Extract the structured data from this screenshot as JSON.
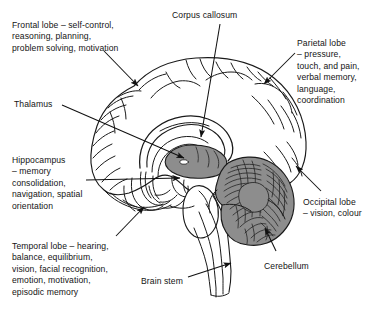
{
  "diagram": {
    "colors": {
      "ink": "#1a1a1a",
      "thalamus_fill": "#8d8d8d",
      "cerebellum_fill": "#8d8d8d",
      "background": "#ffffff"
    },
    "labels": [
      {
        "id": "frontal-lobe",
        "text": "Frontal lobe – self-control,\nreasoning, planning,\nproblem solving, motivation",
        "x": 12,
        "y": 20,
        "align": "left"
      },
      {
        "id": "corpus-callosum",
        "text": "Corpus callosum",
        "x": 172,
        "y": 10,
        "align": "left"
      },
      {
        "id": "parietal-lobe",
        "text": "Parietal lobe\n– pressure,\ntouch, and pain,\nverbal memory,\nlanguage,\ncoordination",
        "x": 297,
        "y": 38,
        "align": "left"
      },
      {
        "id": "thalamus",
        "text": "Thalamus",
        "x": 14,
        "y": 99,
        "align": "left"
      },
      {
        "id": "hippocampus",
        "text": "Hippocampus\n– memory\nconsolidation,\nnavigation, spatial\norientation",
        "x": 12,
        "y": 155,
        "align": "left"
      },
      {
        "id": "occipital-lobe",
        "text": "Occipital lobe\n– vision, colour",
        "x": 303,
        "y": 197,
        "align": "left"
      },
      {
        "id": "temporal-lobe",
        "text": "Temporal lobe – hearing,\nbalance, equilibrium,\nvision, facial recognition,\nemotion, motivation,\nepisodic memory",
        "x": 12,
        "y": 241,
        "align": "left"
      },
      {
        "id": "brain-stem",
        "text": "Brain stem",
        "x": 141,
        "y": 276,
        "align": "left"
      },
      {
        "id": "cerebellum",
        "text": "Cerebellum",
        "x": 264,
        "y": 261,
        "align": "left"
      }
    ],
    "leaders": [
      {
        "id": "frontal-lobe-leader",
        "from": [
          104,
          51
        ],
        "to": [
          138,
          86
        ],
        "arrow": true
      },
      {
        "id": "corpus-callosum-leader",
        "from": [
          220,
          24
        ],
        "to": [
          201,
          137
        ],
        "arrow": true
      },
      {
        "id": "parietal-lobe-leader",
        "from": [
          295,
          53
        ],
        "to": [
          264,
          84
        ],
        "arrow": true
      },
      {
        "id": "thalamus-leader",
        "from": [
          62,
          105
        ],
        "to": [
          184,
          158
        ],
        "arrow": true
      },
      {
        "id": "hippocampus-leader",
        "from": [
          86,
          180
        ],
        "to": [
          180,
          178
        ],
        "arrow": true
      },
      {
        "id": "occipital-lobe-leader",
        "from": [
          321,
          191
        ],
        "to": [
          296,
          166
        ],
        "arrow": true
      },
      {
        "id": "temporal-lobe-leader",
        "from": [
          116,
          236
        ],
        "to": [
          144,
          207
        ],
        "arrow": true
      },
      {
        "id": "brain-stem-leader",
        "from": [
          188,
          277
        ],
        "to": [
          231,
          263
        ],
        "arrow": true
      },
      {
        "id": "cerebellum-leader",
        "from": [
          276,
          251
        ],
        "to": [
          265,
          228
        ],
        "arrow": true
      }
    ],
    "structures": [
      {
        "id": "cerebral-cortex",
        "name": "Cerebral cortex (gyri and sulci)",
        "fill": "none"
      },
      {
        "id": "corpus-callosum-body",
        "name": "Corpus callosum",
        "fill": "none"
      },
      {
        "id": "thalamus-mass",
        "name": "Thalamus",
        "fill": "#8d8d8d"
      },
      {
        "id": "cerebellum-mass",
        "name": "Cerebellum with folia",
        "fill": "#8d8d8d"
      },
      {
        "id": "brain-stem-body",
        "name": "Brain stem / medulla",
        "fill": "none"
      },
      {
        "id": "hippocampus-body",
        "name": "Hippocampus / fornix region",
        "fill": "none"
      }
    ]
  }
}
